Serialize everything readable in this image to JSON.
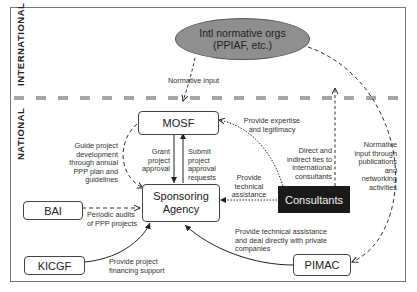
{
  "regions": {
    "international": "INTERNATIONAL",
    "national": "NATIONAL"
  },
  "nodes": {
    "intl_orgs": "Intl normative orgs\n(PPIAF, etc.)",
    "mosf": "MOSF",
    "sponsoring_agency": "Sponsoring\nAgency",
    "bai": "BAI",
    "kicgf": "KICGF",
    "consultants": "Consultants",
    "pimac": "PIMAC"
  },
  "edges": {
    "normative_input": "Normative input",
    "guide_project": "Guide project\ndevelopment\nthrough annual\nPPP plan and\nguidelines",
    "grant_approval": "Grant\nproject\napproval",
    "submit_requests": "Submit\nproject\napproval\nrequests",
    "expertise_legitimacy": "Provide expertise\nand legitimacy",
    "technical_assistance": "Provide\ntechnical\nassistance",
    "direct_indirect_ties": "Direct and\nindirect ties to\ninternational\nconsultants",
    "normative_publications": "Normative\ninput through\npublications\nand\nnetworking\nactivities",
    "periodic_audits": "Periodic audits\nof PPP projects",
    "financing_support": "Provide project\nfinancing support",
    "pimac_assistance": "Provide technical assistance\nand deal directly with private\ncompanies"
  },
  "colors": {
    "ellipse_fill": "#8f8f8f",
    "consultants_fill": "#1a1a1a",
    "divider": "#a6a6a6"
  }
}
